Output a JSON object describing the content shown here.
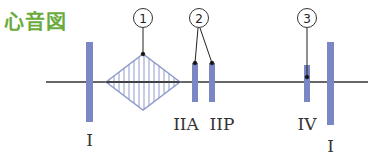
{
  "title": "心音図",
  "colors": {
    "title": "#6bab3e",
    "bar": "#7b86c4",
    "diamond": "#8e9bcc",
    "baseline": "#333333"
  },
  "markers": [
    {
      "id": "1",
      "glyph": "①",
      "label": "murmur"
    },
    {
      "id": "2",
      "glyph": "②",
      "label": "split second sound"
    },
    {
      "id": "3",
      "glyph": "③",
      "label": "fourth sound"
    }
  ],
  "sounds": [
    {
      "label": "I",
      "name": "first-sound"
    },
    {
      "label": "IIA",
      "name": "second-sound-aortic"
    },
    {
      "label": "IIP",
      "name": "second-sound-pulmonic"
    },
    {
      "label": "IV",
      "name": "fourth-sound"
    },
    {
      "label": "I",
      "name": "first-sound-next"
    }
  ]
}
